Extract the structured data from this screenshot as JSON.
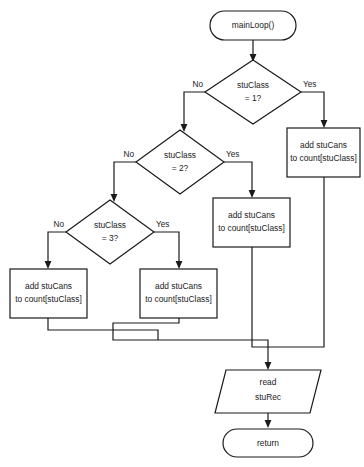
{
  "diagram": {
    "stroke_color": "#1a1a1a",
    "fill_color": "#ffffff",
    "nodes": {
      "start": {
        "label": "mainLoop()",
        "shape": "terminator"
      },
      "decision1": {
        "line1": "stuClass",
        "line2": "= 1?",
        "shape": "decision"
      },
      "decision2": {
        "line1": "stuClass",
        "line2": "= 2?",
        "shape": "decision"
      },
      "decision3": {
        "line1": "stuClass",
        "line2": "= 3?",
        "shape": "decision"
      },
      "process1": {
        "line1": "add stuCans",
        "line2": "to count[stuClass]",
        "shape": "process"
      },
      "process2": {
        "line1": "add stuCans",
        "line2": "to count[stuClass]",
        "shape": "process"
      },
      "process3": {
        "line1": "add stuCans",
        "line2": "to count[stuClass]",
        "shape": "process"
      },
      "process4": {
        "line1": "add stuCans",
        "line2": "to count[stuClass]",
        "shape": "process"
      },
      "io_read": {
        "line1": "read",
        "line2": "stuRec",
        "shape": "input-output"
      },
      "end": {
        "label": "return",
        "shape": "terminator"
      }
    },
    "edge_labels": {
      "d1_no": "No",
      "d1_yes": "Yes",
      "d2_no": "No",
      "d2_yes": "Yes",
      "d3_no": "No",
      "d3_yes": "Yes"
    }
  }
}
